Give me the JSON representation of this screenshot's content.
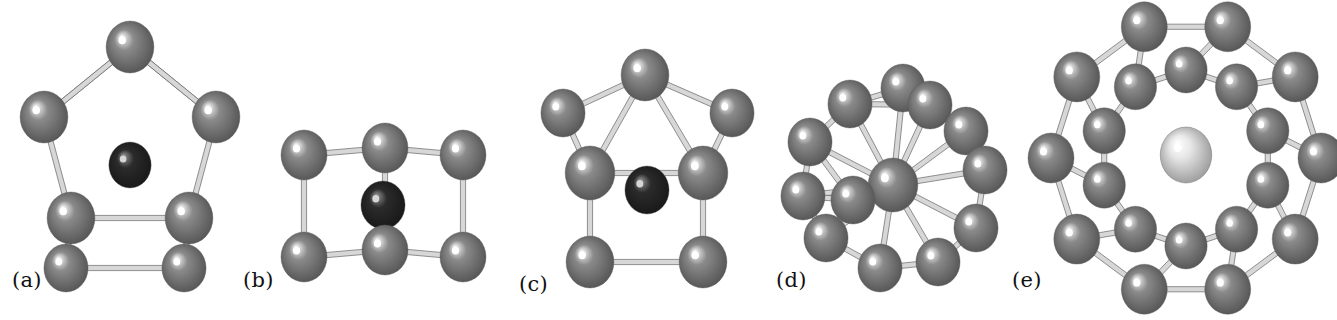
{
  "figure": {
    "background_color": "#ffffff",
    "caption_style": "lowercase letter in parentheses",
    "atom_colors": {
      "shell_atom": "#8a8a8a",
      "shell_atom_highlight": "#ffffff",
      "shell_atom_shadow": "#4a4a4a",
      "dark_center_atom": "#2b2b2b",
      "dark_center_highlight": "#9a9a9a",
      "light_center_atom": "#e8e8e8",
      "light_center_shadow": "#8c8c8c",
      "bond_color": "#8e8e8e",
      "bond_outline": "#5f5f5f"
    },
    "panels": [
      {
        "id": "a",
        "label": "(a)",
        "label_x": 12,
        "label_y": 268,
        "description": "Pentagonal prism-like cage with a single dark central atom",
        "shell_atom_count": 7,
        "center_atom_count": 1,
        "center_atom_type": "dark",
        "sphere_radius": 25,
        "atoms": [
          {
            "x": 130,
            "y": 47,
            "r": 26,
            "type": "shell"
          },
          {
            "x": 44,
            "y": 117,
            "r": 26,
            "type": "shell"
          },
          {
            "x": 216,
            "y": 117,
            "r": 26,
            "type": "shell"
          },
          {
            "x": 71,
            "y": 218,
            "r": 26,
            "type": "shell"
          },
          {
            "x": 189,
            "y": 218,
            "r": 26,
            "type": "shell"
          },
          {
            "x": 66,
            "y": 268,
            "r": 24,
            "type": "shell"
          },
          {
            "x": 184,
            "y": 268,
            "r": 24,
            "type": "shell"
          },
          {
            "x": 130,
            "y": 165,
            "r": 23,
            "type": "dark"
          }
        ],
        "bonds": [
          [
            0,
            1
          ],
          [
            0,
            2
          ],
          [
            1,
            3
          ],
          [
            2,
            4
          ],
          [
            3,
            4
          ],
          [
            3,
            5
          ],
          [
            4,
            6
          ],
          [
            5,
            6
          ],
          [
            0,
            1
          ],
          [
            0,
            2
          ]
        ]
      },
      {
        "id": "b",
        "label": "(b)",
        "label_x": 243,
        "label_y": 268,
        "description": "Cubic/prismatic cage of six atoms with a dark central atom",
        "shell_atom_count": 6,
        "center_atom_count": 1,
        "center_atom_type": "dark",
        "sphere_radius": 24,
        "atoms": [
          {
            "x": 304,
            "y": 155,
            "r": 25,
            "type": "shell"
          },
          {
            "x": 385,
            "y": 148,
            "r": 25,
            "type": "shell"
          },
          {
            "x": 463,
            "y": 155,
            "r": 25,
            "type": "shell"
          },
          {
            "x": 304,
            "y": 257,
            "r": 25,
            "type": "shell"
          },
          {
            "x": 385,
            "y": 250,
            "r": 25,
            "type": "shell"
          },
          {
            "x": 463,
            "y": 257,
            "r": 25,
            "type": "shell"
          },
          {
            "x": 383,
            "y": 205,
            "r": 24,
            "type": "dark"
          }
        ],
        "bonds": [
          [
            0,
            1
          ],
          [
            1,
            2
          ],
          [
            3,
            4
          ],
          [
            4,
            5
          ],
          [
            0,
            3
          ],
          [
            1,
            4
          ],
          [
            2,
            5
          ]
        ]
      },
      {
        "id": "c",
        "label": "(c)",
        "label_x": 519,
        "label_y": 272,
        "description": "Capped pentagonal prism with an apex atom and dark central atom",
        "shell_atom_count": 9,
        "center_atom_count": 1,
        "center_atom_type": "dark",
        "sphere_radius": 25,
        "atoms": [
          {
            "x": 645,
            "y": 75,
            "r": 26,
            "type": "shell"
          },
          {
            "x": 563,
            "y": 113,
            "r": 24,
            "type": "shell"
          },
          {
            "x": 732,
            "y": 113,
            "r": 24,
            "type": "shell"
          },
          {
            "x": 590,
            "y": 173,
            "r": 27,
            "type": "shell"
          },
          {
            "x": 703,
            "y": 173,
            "r": 27,
            "type": "shell"
          },
          {
            "x": 590,
            "y": 262,
            "r": 26,
            "type": "shell"
          },
          {
            "x": 703,
            "y": 262,
            "r": 26,
            "type": "shell"
          },
          {
            "x": 647,
            "y": 190,
            "r": 24,
            "type": "dark"
          }
        ],
        "bonds": [
          [
            0,
            1
          ],
          [
            0,
            2
          ],
          [
            0,
            3
          ],
          [
            0,
            4
          ],
          [
            1,
            3
          ],
          [
            2,
            4
          ],
          [
            3,
            4
          ],
          [
            3,
            5
          ],
          [
            4,
            6
          ],
          [
            5,
            6
          ]
        ]
      },
      {
        "id": "d",
        "label": "(d)",
        "label_x": 776,
        "label_y": 268,
        "description": "Icosahedral-like cluster of twelve outer atoms around one central atom",
        "shell_atom_count": 12,
        "center_atom_count": 1,
        "center_atom_type": "shell",
        "sphere_radius": 24,
        "atoms": [
          {
            "x": 903,
            "y": 88,
            "r": 24,
            "type": "shell"
          },
          {
            "x": 850,
            "y": 104,
            "r": 24,
            "type": "shell"
          },
          {
            "x": 810,
            "y": 142,
            "r": 24,
            "type": "shell"
          },
          {
            "x": 803,
            "y": 196,
            "r": 24,
            "type": "shell"
          },
          {
            "x": 826,
            "y": 238,
            "r": 24,
            "type": "shell"
          },
          {
            "x": 880,
            "y": 268,
            "r": 24,
            "type": "shell"
          },
          {
            "x": 938,
            "y": 262,
            "r": 24,
            "type": "shell"
          },
          {
            "x": 976,
            "y": 228,
            "r": 24,
            "type": "shell"
          },
          {
            "x": 985,
            "y": 170,
            "r": 24,
            "type": "shell"
          },
          {
            "x": 966,
            "y": 131,
            "r": 24,
            "type": "shell"
          },
          {
            "x": 930,
            "y": 105,
            "r": 24,
            "type": "shell"
          },
          {
            "x": 853,
            "y": 200,
            "r": 24,
            "type": "shell"
          },
          {
            "x": 893,
            "y": 185,
            "r": 27,
            "type": "shell"
          }
        ],
        "bonds": [
          [
            0,
            1
          ],
          [
            1,
            2
          ],
          [
            2,
            3
          ],
          [
            3,
            4
          ],
          [
            4,
            5
          ],
          [
            5,
            6
          ],
          [
            6,
            7
          ],
          [
            7,
            8
          ],
          [
            8,
            9
          ],
          [
            9,
            10
          ],
          [
            10,
            0
          ],
          [
            12,
            0
          ],
          [
            12,
            1
          ],
          [
            12,
            2
          ],
          [
            12,
            3
          ],
          [
            12,
            4
          ],
          [
            12,
            5
          ],
          [
            12,
            6
          ],
          [
            12,
            7
          ],
          [
            12,
            8
          ],
          [
            12,
            9
          ],
          [
            12,
            10
          ],
          [
            11,
            3
          ],
          [
            11,
            4
          ],
          [
            11,
            2
          ],
          [
            0,
            10
          ],
          [
            1,
            10
          ]
        ]
      },
      {
        "id": "e",
        "label": "(e)",
        "label_x": 1012,
        "label_y": 268,
        "description": "Double-ring cage: outer ring and inner ring of atoms enclosing one light central atom",
        "shell_atom_count": 20,
        "center_atom_count": 1,
        "center_atom_type": "light",
        "sphere_radius": 25,
        "outer_ring_count": 10,
        "inner_ring_count": 10,
        "ring_center_x": 1186,
        "ring_center_y": 158,
        "outer_ring_radius_x": 135,
        "outer_ring_radius_y": 138,
        "inner_ring_radius_x": 86,
        "inner_ring_radius_y": 88,
        "center_atom": {
          "x": 1186,
          "y": 155,
          "r": 28,
          "type": "light"
        }
      }
    ]
  }
}
